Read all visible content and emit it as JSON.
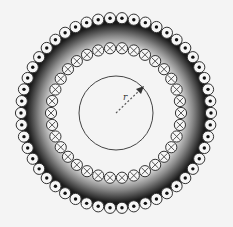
{
  "diagram": {
    "center": [
      116,
      113
    ],
    "shaded_ring": {
      "inner_radius": 68,
      "outer_radius": 96,
      "dark_color": "#1a1a1a",
      "light_color": "#f4f4f4"
    },
    "outer_winding": {
      "count": 50,
      "radius": 95,
      "conductor_radius": 5.6,
      "symbol": "dot",
      "direction": "out-of-page"
    },
    "inner_winding": {
      "count": 34,
      "radius": 65,
      "conductor_radius": 5.6,
      "symbol": "cross",
      "direction": "into-page"
    },
    "amperian_loop": {
      "radius": 37,
      "stroke": "#444444"
    },
    "radius_arrow": {
      "label": "r",
      "angle_deg": -45,
      "length": 33
    }
  }
}
